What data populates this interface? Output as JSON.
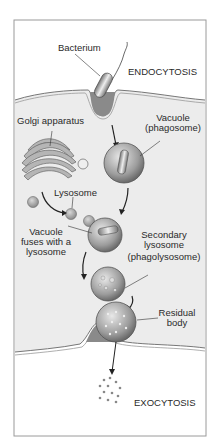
{
  "labels": {
    "bacterium": "Bacterium",
    "endocytosis": "ENDOCYTOSIS",
    "golgi": "Golgi apparatus",
    "vacuole_1": "Vacuole",
    "vacuole_2": "(phagosome)",
    "lysosome": "Lysosome",
    "fuses_1": "Vacuole",
    "fuses_2": "fuses with a",
    "fuses_3": "lysosome",
    "secondary_1": "Secondary",
    "secondary_2": "lysosome",
    "secondary_3": "(phagolysosome)",
    "residual_1": "Residual",
    "residual_2": "body",
    "exocytosis": "EXOCYTOSIS"
  },
  "colors": {
    "frame": "#9a9a9a",
    "cytoplasm": "#ececec",
    "outside": "#ffffff",
    "vesicle": "#a8a8a8"
  }
}
